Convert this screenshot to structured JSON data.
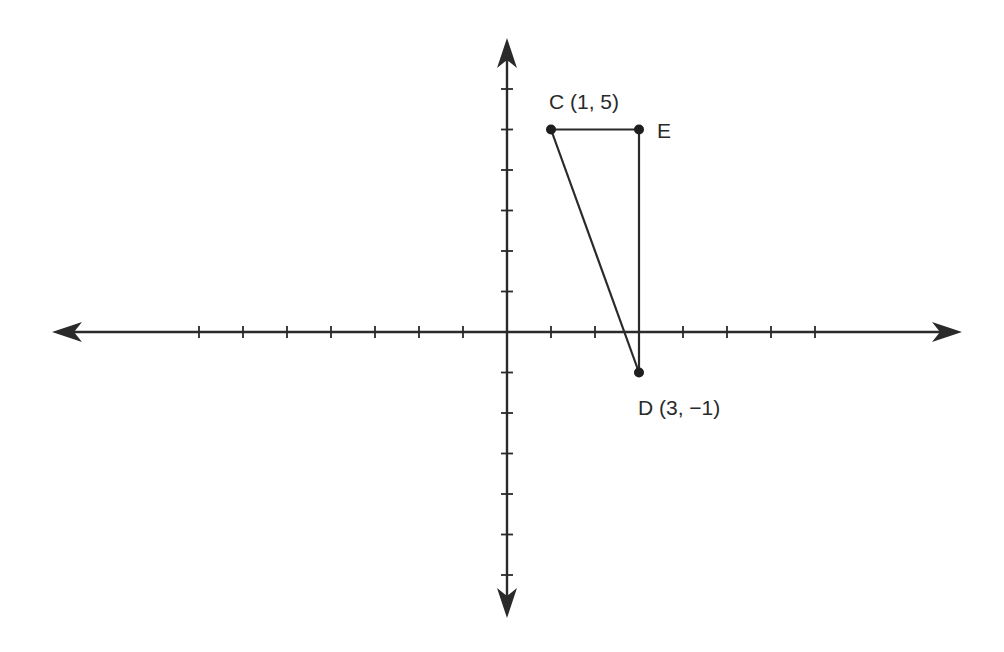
{
  "diagram": {
    "type": "coordinate-plane-triangle",
    "colors": {
      "stroke": "#2a2a2a",
      "background": "#ffffff"
    },
    "axes": {
      "x_ticks": [
        -7,
        -6,
        -5,
        -4,
        -3,
        -2,
        -1,
        1,
        2,
        3,
        4,
        5,
        6,
        7
      ],
      "y_ticks": [
        -6,
        -5,
        -4,
        -3,
        -2,
        -1,
        1,
        2,
        3,
        4,
        5,
        6
      ],
      "arrows": "both ends on both axes",
      "tick_labels_shown": false
    },
    "points": [
      {
        "name": "C",
        "x": 1,
        "y": 5,
        "label": "C (1, 5)"
      },
      {
        "name": "E",
        "x": 3,
        "y": 5,
        "label": "E"
      },
      {
        "name": "D",
        "x": 3,
        "y": -1,
        "label": "D (3, −1)"
      }
    ],
    "segments": [
      {
        "from": "C",
        "to": "E"
      },
      {
        "from": "E",
        "to": "D"
      },
      {
        "from": "C",
        "to": "D"
      }
    ]
  },
  "labels": {
    "C": "C (1, 5)",
    "E": "E",
    "D": "D (3, −1)"
  }
}
